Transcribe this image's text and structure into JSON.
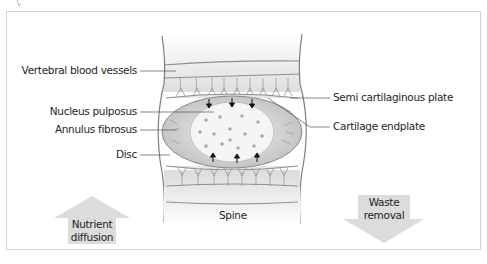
{
  "diagram": {
    "title": "",
    "labels_left": [
      {
        "id": "vertebral-blood-vessels",
        "text": "Vertebral blood vessels"
      },
      {
        "id": "nucleus-pulposus",
        "text": "Nucleus pulposus"
      },
      {
        "id": "annulus-fibrosus",
        "text": "Annulus fibrosus"
      },
      {
        "id": "disc",
        "text": "Disc"
      }
    ],
    "labels_right": [
      {
        "id": "semi-cartilaginous-plate",
        "text": "Semi cartilaginous plate"
      },
      {
        "id": "cartilage-endplate",
        "text": "Cartilage endplate"
      }
    ],
    "bottom_label": "Spine",
    "arrows": {
      "up": {
        "line1": "Nutrient",
        "line2": "diffusion",
        "direction": "up"
      },
      "down": {
        "line1": "Waste",
        "line2": "removal",
        "direction": "down"
      }
    },
    "colors": {
      "frame": "#d4d4d4",
      "arrow_fill": "#dcdcdc",
      "vertebra": "#e4e4e4",
      "annulus": "#c9c9c9",
      "nucleus": "#f4f4f4",
      "dots": "#a9a9a9",
      "outline": "#8a8a8a"
    }
  }
}
